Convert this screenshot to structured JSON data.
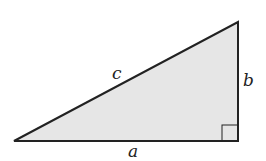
{
  "diagram": {
    "type": "right-triangle",
    "fill_color": "#e6e6e6",
    "stroke_color": "#222222",
    "vertices": {
      "left": [
        14,
        141
      ],
      "right_angle": [
        238,
        141
      ],
      "top": [
        238,
        22
      ]
    },
    "labels": {
      "hypotenuse": "c",
      "vertical_leg": "b",
      "horizontal_leg": "a"
    },
    "right_angle_marker": true
  }
}
